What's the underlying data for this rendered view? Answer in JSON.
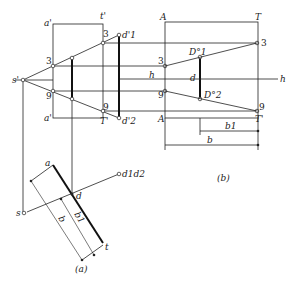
{
  "figure": {
    "subfigure_a": {
      "caption": "(a)",
      "labels": {
        "a_prime_top": "a'",
        "t_prime_top": "t'",
        "a_prime_bottom": "a'",
        "t_prime_bottom": "T'",
        "s_prime": "s'",
        "p3_left": "3",
        "p9_left": "9",
        "p3_right": "3",
        "p9_right": "9",
        "d1_prime": "d'1",
        "d2_prime": "d'2",
        "a": "a",
        "t": "t",
        "s": "s",
        "d": "d",
        "d1d2": "d1d2",
        "dim_b": "b",
        "dim_b1": "b1"
      }
    },
    "subfigure_b": {
      "caption": "(b)",
      "labels": {
        "A_top": "A",
        "T_top": "T",
        "A_bottom": "A",
        "T_bottom": "T'",
        "p3_left": "3",
        "p9_left": "9",
        "p3_right": "3",
        "p9_right": "9",
        "D1": "D°1",
        "D2": "D°2",
        "d": "d",
        "h_left": "h",
        "h_mid": "h",
        "h_right": "h",
        "dim_b1": "b1",
        "dim_b": "b"
      }
    },
    "colors": {
      "line": "#222222",
      "background": "#ffffff"
    }
  }
}
